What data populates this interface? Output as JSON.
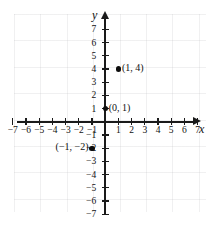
{
  "chart_data": {
    "type": "scatter",
    "title": "",
    "xlabel": "x",
    "ylabel": "y",
    "xlim": [
      -7.5,
      7.5
    ],
    "ylim": [
      -7.5,
      7.5
    ],
    "grid": true,
    "legend": null,
    "x_ticks": [
      -7,
      -6,
      -5,
      -4,
      -3,
      -2,
      -1,
      1,
      2,
      3,
      4,
      5,
      6,
      7
    ],
    "y_ticks": [
      7,
      6,
      5,
      4,
      3,
      2,
      1,
      -1,
      -2,
      -3,
      -4,
      -5,
      -6,
      -7
    ],
    "x_tick_labels": [
      "−7",
      "−6",
      "−5",
      "−4",
      "−3",
      "−2",
      "−1",
      "1",
      "2",
      "3",
      "4",
      "5",
      "6",
      "7"
    ],
    "y_tick_labels": [
      "7",
      "6",
      "5",
      "4",
      "3",
      "2",
      "1",
      "−1",
      "−2",
      "−3",
      "−4",
      "−5",
      "−6",
      "−7"
    ],
    "points": [
      {
        "x": 1,
        "y": 4,
        "label": "(1, 4)",
        "label_side": "right"
      },
      {
        "x": 0,
        "y": 1,
        "label": "(0, 1)",
        "label_side": "right"
      },
      {
        "x": -1,
        "y": -2,
        "label": "(−1, −2)",
        "label_side": "left"
      }
    ],
    "point_color": "#0d0d0d",
    "axis_color": "#1a1a1a",
    "grid_color": "#96969b"
  },
  "axes": {
    "x_name": "x",
    "y_name": "y"
  }
}
